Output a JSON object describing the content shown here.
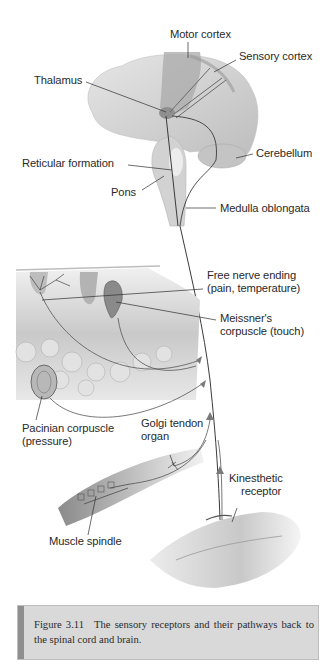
{
  "figure": {
    "regions": [
      "brain",
      "skin",
      "muscle",
      "joint"
    ],
    "labels": {
      "motor_cortex": "Motor cortex",
      "sensory_cortex": "Sensory cortex",
      "thalamus": "Thalamus",
      "cerebellum": "Cerebellum",
      "reticular_formation": "Reticular formation",
      "pons": "Pons",
      "medulla_oblongata": "Medulla oblongata",
      "free_nerve_ending_line1": "Free nerve ending",
      "free_nerve_ending_line2": "(pain, temperature)",
      "meissner_line1": "Meissner's",
      "meissner_line2": "corpuscle (touch)",
      "pacinian_line1": "Pacinian corpuscle",
      "pacinian_line2": "(pressure)",
      "golgi_line1": "Golgi tendon",
      "golgi_line2": "organ",
      "kinesthetic_line1": "Kinesthetic",
      "kinesthetic_line2": "receptor",
      "muscle_spindle": "Muscle spindle"
    },
    "colors": {
      "brain": "#d6d6d6",
      "cortex_band": "#a9a9a9",
      "line": "#3a3a3a",
      "arrow": "#7a7a7a",
      "tissue": "#cfcfcf"
    }
  },
  "caption": {
    "number": "Figure 3.11",
    "text": "The sensory receptors and their pathways back to the spinal cord and brain."
  }
}
